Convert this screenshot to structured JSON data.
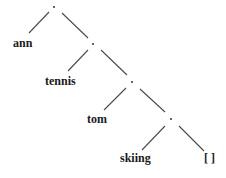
{
  "diagram": {
    "type": "binary-tree",
    "nodes": [
      {
        "id": "n1",
        "label": ".",
        "x": 54,
        "y": 7
      },
      {
        "id": "n2",
        "label": ".",
        "x": 93,
        "y": 44
      },
      {
        "id": "n3",
        "label": ".",
        "x": 132,
        "y": 82
      },
      {
        "id": "n4",
        "label": ".",
        "x": 171,
        "y": 119
      }
    ],
    "leaves": [
      {
        "id": "l1",
        "label": "ann",
        "x": 13,
        "y": 37
      },
      {
        "id": "l2",
        "label": "tennis",
        "x": 45,
        "y": 75
      },
      {
        "id": "l3",
        "label": "tom",
        "x": 87,
        "y": 113
      },
      {
        "id": "l4",
        "label": "skiing",
        "x": 120,
        "y": 152
      },
      {
        "id": "l5",
        "label": "[ ]",
        "x": 204,
        "y": 152
      }
    ],
    "edges": [
      {
        "from": "n1",
        "to": "l1",
        "x1": 49,
        "y1": 12,
        "x2": 29,
        "y2": 33
      },
      {
        "from": "n1",
        "to": "n2",
        "x1": 62,
        "y1": 13,
        "x2": 88,
        "y2": 38
      },
      {
        "from": "n2",
        "to": "l2",
        "x1": 88,
        "y1": 50,
        "x2": 68,
        "y2": 71
      },
      {
        "from": "n2",
        "to": "n3",
        "x1": 101,
        "y1": 50,
        "x2": 127,
        "y2": 75
      },
      {
        "from": "n3",
        "to": "l3",
        "x1": 126,
        "y1": 88,
        "x2": 104,
        "y2": 110
      },
      {
        "from": "n3",
        "to": "n4",
        "x1": 140,
        "y1": 89,
        "x2": 165,
        "y2": 112
      },
      {
        "from": "n4",
        "to": "l4",
        "x1": 165,
        "y1": 126,
        "x2": 142,
        "y2": 150
      },
      {
        "from": "n4",
        "to": "l5",
        "x1": 179,
        "y1": 126,
        "x2": 204,
        "y2": 151
      }
    ]
  }
}
